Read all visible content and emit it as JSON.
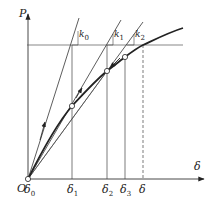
{
  "diagram": {
    "title": "",
    "axes": {
      "y_label": "P",
      "x_label": "δ",
      "origin_label": "O"
    },
    "slope_labels": [
      {
        "base": "k",
        "sub": "0"
      },
      {
        "base": "k",
        "sub": "1"
      },
      {
        "base": "k",
        "sub": "2"
      }
    ],
    "x_ticks": [
      {
        "base": "δ",
        "sub": "0"
      },
      {
        "base": "δ",
        "sub": "1"
      },
      {
        "base": "δ",
        "sub": "2"
      },
      {
        "base": "δ",
        "sub": "3"
      },
      {
        "base": "δ",
        "sub": ""
      }
    ],
    "colors": {
      "line": "#333333",
      "curve": "#222222",
      "background": "#ffffff"
    }
  }
}
